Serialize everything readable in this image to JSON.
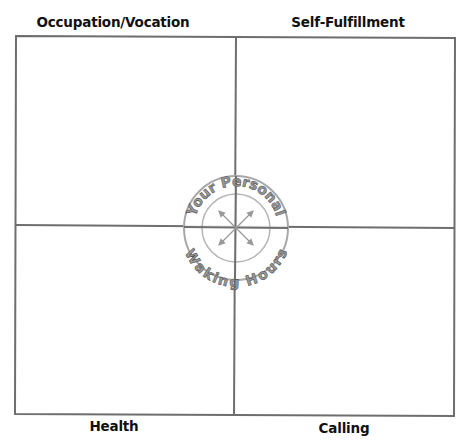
{
  "diagram": {
    "quadrants": {
      "top_left": {
        "label": "Occupation/Vocation"
      },
      "top_right": {
        "label": "Self-Fulfillment"
      },
      "bottom_left": {
        "label": "Health"
      },
      "bottom_right": {
        "label": "Calling"
      }
    },
    "emblem": {
      "top_text": "Your Personal",
      "bottom_text": "Waking Hours"
    },
    "colors": {
      "grid_line": "#6e6e6e",
      "emblem_fill": "#9a9a9a",
      "emblem_stroke": "#555555",
      "label_text": "#111111"
    }
  }
}
